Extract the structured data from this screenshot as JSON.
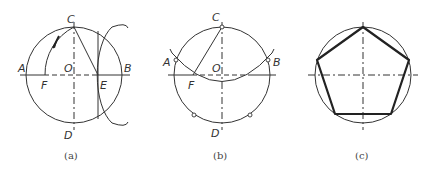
{
  "figure": {
    "panels": [
      {
        "id": "a",
        "caption": "(a)",
        "labels": {
          "C": "C",
          "A": "A",
          "O": "O",
          "B": "B",
          "F": "F",
          "E": "E",
          "D": "D"
        }
      },
      {
        "id": "b",
        "caption": "(b)",
        "labels": {
          "C": "C",
          "A": "A",
          "O": "O",
          "B": "B",
          "F": "F",
          "D": "D"
        }
      },
      {
        "id": "c",
        "caption": "(c)",
        "labels": {}
      }
    ],
    "colors": {
      "line": "#333333",
      "background": "#ffffff"
    }
  }
}
